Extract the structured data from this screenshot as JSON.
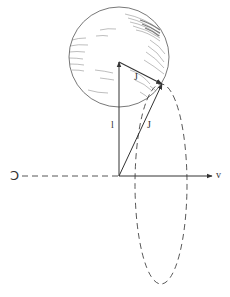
{
  "diagram": {
    "labels": {
      "sphere_vector": "J",
      "vertical_vector": "l",
      "diagonal_vector": "J",
      "horizontal_axis": "v",
      "rotation_symbol": "Ↄ"
    },
    "colors": {
      "line": "#333333",
      "hatch": "#555555",
      "background": "#ffffff"
    }
  }
}
